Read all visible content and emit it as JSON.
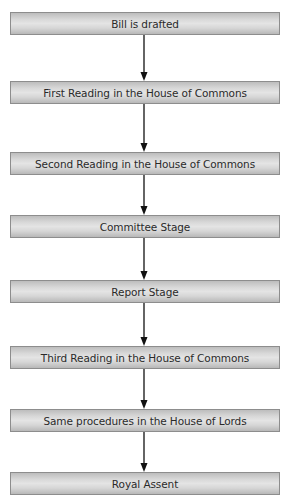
{
  "diagram": {
    "type": "flowchart",
    "direction": "top-to-bottom",
    "steps": [
      {
        "label": "Bill is drafted",
        "top": 12
      },
      {
        "label": "First Reading in the House of Commons",
        "top": 81
      },
      {
        "label": "Second Reading in the House of Commons",
        "top": 152
      },
      {
        "label": "Committee Stage",
        "top": 215
      },
      {
        "label": "Report Stage",
        "top": 280
      },
      {
        "label": "Third Reading in the House of Commons",
        "top": 346
      },
      {
        "label": "Same procedures in the House of Lords",
        "top": 409
      },
      {
        "label": "Royal Assent",
        "top": 472
      }
    ],
    "edges": [
      {
        "from": 0,
        "to": 1
      },
      {
        "from": 1,
        "to": 2
      },
      {
        "from": 2,
        "to": 3
      },
      {
        "from": 3,
        "to": 4
      },
      {
        "from": 4,
        "to": 5
      },
      {
        "from": 5,
        "to": 6
      },
      {
        "from": 6,
        "to": 7
      }
    ],
    "colors": {
      "box_border": "#8d8d8d",
      "box_fill_light": "#e4e4e4",
      "box_fill_dark": "#b8b8b8",
      "arrow": "#111111",
      "text": "#2a2a2a"
    }
  }
}
